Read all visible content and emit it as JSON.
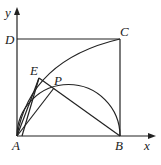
{
  "diagram": {
    "type": "geometry",
    "axes": {
      "x_label": "x",
      "y_label": "y"
    },
    "points": {
      "A": {
        "label": "A",
        "x": 17,
        "y": 136
      },
      "B": {
        "label": "B",
        "x": 120,
        "y": 136
      },
      "C": {
        "label": "C",
        "x": 120,
        "y": 39
      },
      "D": {
        "label": "D",
        "x": 17,
        "y": 39
      },
      "E": {
        "label": "E",
        "x": 39,
        "y": 78
      },
      "P": {
        "label": "P",
        "x": 54,
        "y": 88
      }
    },
    "segments": [
      "AB",
      "BC",
      "CD",
      "DA",
      "AE",
      "AP",
      "EB",
      "EP"
    ],
    "arcs": [
      "arc A-E-C",
      "semicircle on AB through P"
    ]
  }
}
